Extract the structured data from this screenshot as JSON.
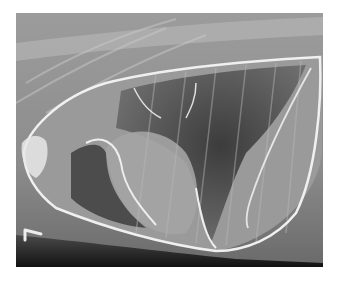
{
  "image": {
    "description": "Lateral thoracic radiograph with bright outlined pleural/thoracic cavity boundary",
    "marker_label": "L",
    "colors": {
      "background": "#ffffff",
      "film_base": "#8a8a8a",
      "soft_tissue": "#a6a6a6",
      "lung_dark": "#3a3a3a",
      "bone_bright": "#e8e8e8",
      "outline": "#f2f2f2",
      "bottom_shadow": "#1a1a1a"
    }
  }
}
